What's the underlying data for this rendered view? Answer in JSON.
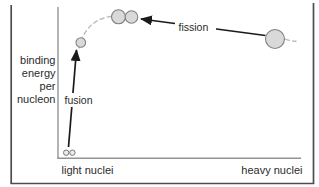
{
  "figure": {
    "y_axis_label_lines": [
      "binding",
      "energy",
      "per",
      "nucleon"
    ],
    "x_axis_left_label": "light nuclei",
    "x_axis_right_label": "heavy nuclei",
    "fusion_label": "fusion",
    "fission_label": "fission"
  },
  "icons": {
    "light_nuclei_pair": "two-tiny-nuclei-icon",
    "small_nucleus": "small-nucleus-icon",
    "fission_fragments_pair": "two-medium-nuclei-icon",
    "heavy_nucleus": "large-nucleus-icon"
  },
  "colors": {
    "background": "#ffffff",
    "frame_border": "#4d4d4d",
    "axis": "#949494",
    "dashed_curve": "#bcbcbc",
    "nucleus_fill": "#d9d9d9",
    "nucleus_stroke": "#808080",
    "arrow": "#1a1a1a",
    "text": "#2b2b2b"
  }
}
